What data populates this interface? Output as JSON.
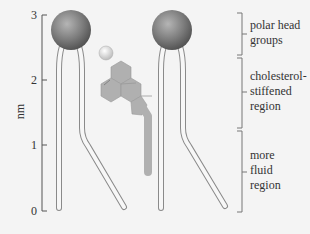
{
  "axis": {
    "label": "nm",
    "ticks": [
      {
        "value": "3",
        "y": 15
      },
      {
        "value": "2",
        "y": 80
      },
      {
        "value": "1",
        "y": 145
      },
      {
        "value": "0",
        "y": 211
      }
    ]
  },
  "regions": [
    {
      "label": "polar head\ngroups",
      "top": 13,
      "bottom": 55
    },
    {
      "label": "cholesterol-\nstiffened\nregion",
      "top": 57,
      "bottom": 128
    },
    {
      "label": "more\nfluid\nregion",
      "top": 130,
      "bottom": 212
    }
  ],
  "colors": {
    "background": "#f4f4f4",
    "head_fill": "#7d7d7d",
    "tail_stroke": "#8a8a8a",
    "cholesterol_fill": "#b0b0b0",
    "axis": "#555555"
  }
}
